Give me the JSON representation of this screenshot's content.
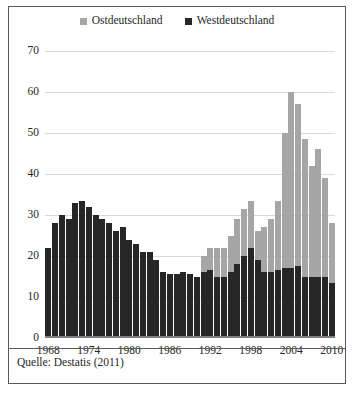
{
  "legend": {
    "items": [
      {
        "label": "Ostdeutschland",
        "color": "#a6a6a6",
        "icon": "square-marker-icon"
      },
      {
        "label": "Westdeutschland",
        "color": "#262626",
        "icon": "square-marker-icon"
      }
    ]
  },
  "caption": {
    "text": "Quelle: Destatis (2011)"
  },
  "chart_data": {
    "type": "bar",
    "stacked": true,
    "title": "",
    "subtitle": "",
    "xlabel": "",
    "ylabel": "",
    "ylim": [
      0,
      70
    ],
    "ytick_step": 10,
    "yticks": [
      70,
      60,
      50,
      40,
      30,
      20,
      10,
      0
    ],
    "grid": true,
    "legend_position": "top-center",
    "xticks": [
      1968,
      1974,
      1980,
      1986,
      1992,
      1998,
      2004,
      2010
    ],
    "categories": [
      1968,
      1969,
      1970,
      1971,
      1972,
      1973,
      1974,
      1975,
      1976,
      1977,
      1978,
      1979,
      1980,
      1981,
      1982,
      1983,
      1984,
      1985,
      1986,
      1987,
      1988,
      1989,
      1990,
      1991,
      1992,
      1993,
      1994,
      1995,
      1996,
      1997,
      1998,
      1999,
      2000,
      2001,
      2002,
      2003,
      2004,
      2005,
      2006,
      2007,
      2008,
      2009,
      2010
    ],
    "series": [
      {
        "name": "Westdeutschland",
        "color": "#262626",
        "values": [
          22,
          28,
          30,
          29,
          33,
          33.5,
          32,
          30,
          29,
          28,
          26,
          27,
          24,
          23,
          21,
          21,
          19,
          16,
          15.5,
          15.5,
          16,
          15.5,
          15,
          16,
          16.5,
          15,
          15,
          16,
          18,
          20,
          22,
          19,
          16,
          16,
          16.5,
          17,
          17,
          17.5,
          15,
          15,
          15,
          15,
          13.5
        ]
      },
      {
        "name": "Ostdeutschland",
        "color": "#a6a6a6",
        "values": [
          0,
          0,
          0,
          0,
          0,
          0,
          0,
          0,
          0,
          0,
          0,
          0,
          0,
          0,
          0,
          0,
          0,
          0,
          0,
          0,
          0,
          0,
          0,
          4,
          5.5,
          7,
          7,
          9,
          11,
          11.5,
          11.5,
          7,
          11,
          13,
          17,
          33,
          43,
          39.5,
          33.5,
          27,
          31,
          24,
          14.5
        ]
      }
    ],
    "totals": [
      22,
      28,
      30,
      29,
      33,
      33.5,
      32,
      30,
      29,
      28,
      26,
      27,
      24,
      23,
      21,
      21,
      19,
      16,
      15.5,
      15.5,
      16,
      15.5,
      15,
      20,
      22,
      22,
      22,
      25,
      29,
      31.5,
      33.5,
      26,
      27,
      29,
      33.5,
      50,
      60,
      57,
      48.5,
      42,
      46,
      39,
      28
    ]
  }
}
